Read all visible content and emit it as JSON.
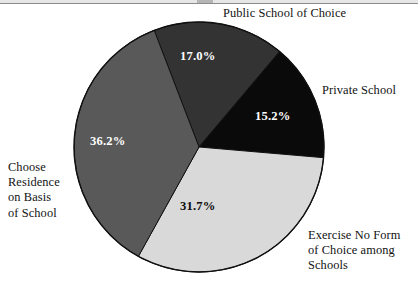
{
  "figure": {
    "name": "school-choice-pie-chart",
    "background": "#ffffff"
  },
  "chart_data": {
    "type": "pie",
    "title": "",
    "xlabel": "",
    "ylabel": "",
    "legend_position": "callout-labels-around-pie",
    "grid": false,
    "units": "percent",
    "categories": [
      "Public School of Choice",
      "Private School",
      "Exercise No Form of Choice among Schools",
      "Choose Residence on Basis of School"
    ],
    "values": [
      17.0,
      15.2,
      31.7,
      36.2
    ],
    "value_labels": [
      "17.0%",
      "15.2%",
      "31.7%",
      "36.2%"
    ],
    "colors": [
      "#333333",
      "#0a0a0a",
      "#d9d9d9",
      "#595959"
    ],
    "slices": [
      {
        "label": "Public School of Choice",
        "value": 17.0,
        "value_label": "17.0%",
        "color": "#333333",
        "label_color": "#ffffff",
        "start_angle_deg": -21.0,
        "end_angle_deg": 40.2,
        "callout": "Public School of Choice",
        "callout_lines": [
          "Public School of Choice"
        ]
      },
      {
        "label": "Private School",
        "value": 15.2,
        "value_label": "15.2%",
        "color": "#0a0a0a",
        "label_color": "#ffffff",
        "start_angle_deg": 40.2,
        "end_angle_deg": 94.9,
        "callout": "Private School",
        "callout_lines": [
          "Private School"
        ]
      },
      {
        "label": "Exercise No Form of Choice among Schools",
        "value": 31.7,
        "value_label": "31.7%",
        "color": "#d9d9d9",
        "label_color": "#0d0d0d",
        "start_angle_deg": 94.9,
        "end_angle_deg": 209.0,
        "callout": "Exercise No Form of Choice among Schools",
        "callout_lines": [
          "Exercise No Form",
          "of Choice among",
          "Schools"
        ]
      },
      {
        "label": "Choose Residence on Basis of School",
        "value": 36.2,
        "value_label": "36.2%",
        "color": "#595959",
        "label_color": "#ffffff",
        "start_angle_deg": 209.0,
        "end_angle_deg": 339.0,
        "callout": "Choose Residence on Basis of School",
        "callout_lines": [
          "Choose",
          "Residence",
          "on Basis",
          "of School"
        ]
      }
    ],
    "geometry": {
      "center_x": 199,
      "center_y": 147,
      "radius": 125,
      "stroke": "#111111",
      "stroke_width": 1
    }
  },
  "labels": {
    "public": "Public School of Choice",
    "private": "Private School",
    "exercise": "Exercise No Form\nof Choice among\nSchools",
    "choose": "Choose\nResidence\non Basis\nof School"
  },
  "percents": {
    "public": "17.0%",
    "private": "15.2%",
    "exercise": "31.7%",
    "choose": "36.2%"
  }
}
